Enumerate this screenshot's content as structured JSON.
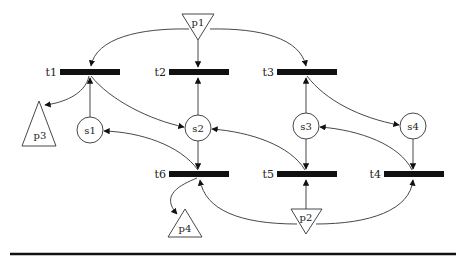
{
  "diagram": {
    "type": "petri-net",
    "transitions": [
      {
        "id": "t1",
        "label": "t1"
      },
      {
        "id": "t2",
        "label": "t2"
      },
      {
        "id": "t3",
        "label": "t3"
      },
      {
        "id": "t4",
        "label": "t4"
      },
      {
        "id": "t5",
        "label": "t5"
      },
      {
        "id": "t6",
        "label": "t6"
      }
    ],
    "states": [
      {
        "id": "s1",
        "label": "s1"
      },
      {
        "id": "s2",
        "label": "s2"
      },
      {
        "id": "s3",
        "label": "s3"
      },
      {
        "id": "s4",
        "label": "s4"
      }
    ],
    "ports": [
      {
        "id": "p1",
        "label": "p1",
        "shape": "inverted-triangle"
      },
      {
        "id": "p2",
        "label": "p2",
        "shape": "inverted-triangle"
      },
      {
        "id": "p3",
        "label": "p3",
        "shape": "triangle"
      },
      {
        "id": "p4",
        "label": "p4",
        "shape": "triangle"
      }
    ],
    "arcs": [
      {
        "from": "p1",
        "to": "t1"
      },
      {
        "from": "p1",
        "to": "t2"
      },
      {
        "from": "p1",
        "to": "t3"
      },
      {
        "from": "s1",
        "to": "t1"
      },
      {
        "from": "s2",
        "to": "t2"
      },
      {
        "from": "s3",
        "to": "t3"
      },
      {
        "from": "t1",
        "to": "p3"
      },
      {
        "from": "t1",
        "to": "s2"
      },
      {
        "from": "t3",
        "to": "s4"
      },
      {
        "from": "t6",
        "to": "s1"
      },
      {
        "from": "t5",
        "to": "s2"
      },
      {
        "from": "t4",
        "to": "s3"
      },
      {
        "from": "s2",
        "to": "t6"
      },
      {
        "from": "s3",
        "to": "t5"
      },
      {
        "from": "s4",
        "to": "t4"
      },
      {
        "from": "t6",
        "to": "p4"
      },
      {
        "from": "p2",
        "to": "t6"
      },
      {
        "from": "p2",
        "to": "t5"
      },
      {
        "from": "p2",
        "to": "t4"
      }
    ]
  },
  "colors": {
    "ink": "#111111",
    "line": "#333333",
    "background": "#ffffff"
  }
}
